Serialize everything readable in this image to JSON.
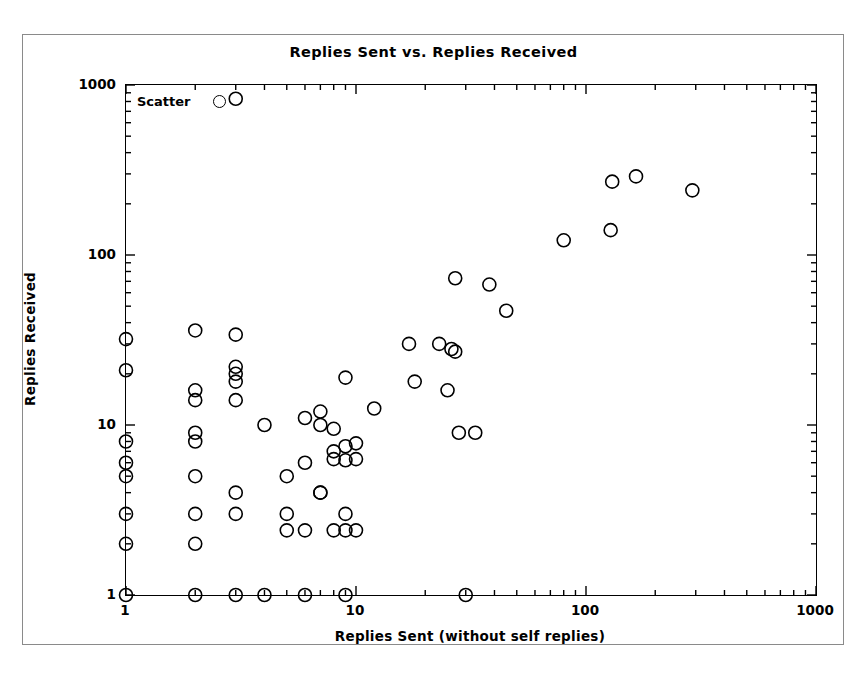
{
  "chart_data": {
    "type": "scatter",
    "title": "Replies Sent vs. Replies Received",
    "xlabel": "Replies Sent (without self replies)",
    "ylabel": "Replies Received",
    "xscale": "log",
    "yscale": "log",
    "xlim": [
      1,
      1000
    ],
    "ylim": [
      1,
      1000
    ],
    "xticks": [
      1,
      10,
      100,
      1000
    ],
    "xtick_labels": [
      "1",
      "10",
      "100",
      "1000"
    ],
    "yticks": [
      1,
      10,
      100,
      1000
    ],
    "ytick_labels": [
      "1",
      "10",
      "100",
      "1000"
    ],
    "grid": false,
    "minor_ticks": true,
    "legend": {
      "position": "upper-left-inside",
      "entries": [
        {
          "label": "Scatter",
          "marker": "open-circle",
          "color": "#000000"
        }
      ]
    },
    "marker": {
      "shape": "open-circle",
      "edge_color": "#000000",
      "fill": "none",
      "size_px": 13
    },
    "series": [
      {
        "name": "Scatter",
        "points": [
          [
            1,
            32
          ],
          [
            1,
            21
          ],
          [
            1,
            8
          ],
          [
            1,
            6
          ],
          [
            1,
            5
          ],
          [
            1,
            3
          ],
          [
            1,
            2
          ],
          [
            1,
            1
          ],
          [
            2,
            36
          ],
          [
            2,
            16
          ],
          [
            2,
            14
          ],
          [
            2,
            9
          ],
          [
            2,
            8
          ],
          [
            2,
            5
          ],
          [
            2,
            3
          ],
          [
            2,
            2
          ],
          [
            2,
            1
          ],
          [
            3,
            830
          ],
          [
            3,
            34
          ],
          [
            3,
            22
          ],
          [
            3,
            20
          ],
          [
            3,
            18
          ],
          [
            3,
            14
          ],
          [
            3,
            4
          ],
          [
            3,
            3
          ],
          [
            3,
            1
          ],
          [
            4,
            10
          ],
          [
            4,
            1
          ],
          [
            5,
            5
          ],
          [
            5,
            3
          ],
          [
            5,
            2.4
          ],
          [
            6,
            6
          ],
          [
            6,
            11
          ],
          [
            6,
            2.4
          ],
          [
            6,
            1
          ],
          [
            7,
            12
          ],
          [
            7,
            10
          ],
          [
            7,
            4
          ],
          [
            7,
            4
          ],
          [
            8,
            9.5
          ],
          [
            8,
            7
          ],
          [
            8,
            6.3
          ],
          [
            8,
            2.4
          ],
          [
            9,
            19
          ],
          [
            9,
            7.5
          ],
          [
            9,
            6.2
          ],
          [
            9,
            3
          ],
          [
            9,
            2.4
          ],
          [
            9,
            1
          ],
          [
            10,
            7.8
          ],
          [
            10,
            6.3
          ],
          [
            10,
            2.4
          ],
          [
            12,
            12.5
          ],
          [
            17,
            30
          ],
          [
            18,
            18
          ],
          [
            23,
            30
          ],
          [
            25,
            16
          ],
          [
            26,
            28
          ],
          [
            27,
            27
          ],
          [
            27,
            73
          ],
          [
            28,
            9
          ],
          [
            30,
            1
          ],
          [
            33,
            9
          ],
          [
            38,
            67
          ],
          [
            45,
            47
          ],
          [
            80,
            122
          ],
          [
            128,
            140
          ],
          [
            130,
            270
          ],
          [
            165,
            290
          ],
          [
            290,
            240
          ]
        ]
      }
    ]
  },
  "figure": {
    "background": "#ffffff",
    "axis_color": "#000000",
    "frame_color": "#8a8a8a"
  }
}
